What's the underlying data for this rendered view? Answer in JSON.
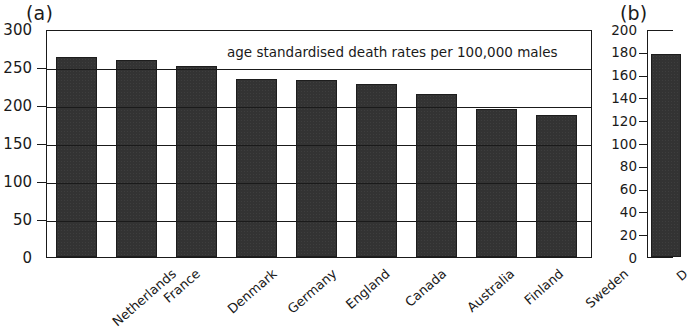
{
  "figure": {
    "panels": [
      {
        "tag": "(a)",
        "annotation": "age standardised death rates per 100,000 males"
      },
      {
        "tag": "(b)",
        "annotation": ""
      }
    ]
  },
  "colors": {
    "bar_fill": "#333333",
    "bar_stroke": "#1d1d1d",
    "axis": "#1a1a1a",
    "background": "#ffffff"
  },
  "chart_data": [
    {
      "type": "bar",
      "panel": "(a)",
      "title": "",
      "annotation": "age standardised death rates per 100,000 males",
      "xlabel": "",
      "ylabel": "",
      "ylim": [
        0,
        300
      ],
      "yticks": [
        0,
        50,
        100,
        150,
        200,
        250,
        300
      ],
      "ytick_labels": [
        "0",
        "50",
        "100",
        "150",
        "200",
        "250",
        "300"
      ],
      "grid": true,
      "legend": "none",
      "categories": [
        "Netherlands",
        "France",
        "Denmark",
        "Germany",
        "England",
        "Canada",
        "Australia",
        "Finland",
        "Sweden"
      ],
      "values": [
        263,
        259,
        251,
        234,
        233,
        227,
        214,
        195,
        187
      ]
    },
    {
      "type": "bar",
      "panel": "(b)",
      "title": "",
      "annotation": "",
      "xlabel": "",
      "ylabel": "",
      "ylim": [
        0,
        200
      ],
      "yticks": [
        0,
        20,
        40,
        60,
        80,
        100,
        120,
        140,
        160,
        180,
        200
      ],
      "ytick_labels": [
        "0",
        "20",
        "40",
        "60",
        "80",
        "100",
        "120",
        "140",
        "160",
        "180",
        "200"
      ],
      "grid": false,
      "legend": "none",
      "categories": [
        "D"
      ],
      "values": [
        178
      ],
      "note_clipped": "panel cropped at right image edge"
    }
  ]
}
